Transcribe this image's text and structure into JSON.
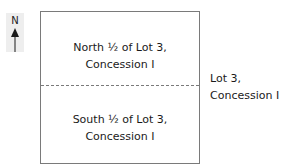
{
  "compass": {
    "label": "N",
    "icon": "north-arrow-icon"
  },
  "lot": {
    "north_half": {
      "line1": "North ½ of Lot 3,",
      "line2": "Concession I"
    },
    "south_half": {
      "line1": "South ½ of Lot 3,",
      "line2": "Concession I"
    },
    "divider_style": "dashed"
  },
  "side_label": {
    "line1": "Lot 3,",
    "line2": "Concession I"
  },
  "colors": {
    "border": "#7a7a7a",
    "compass_bg": "#eeeeee",
    "text": "#1a1a1a"
  }
}
